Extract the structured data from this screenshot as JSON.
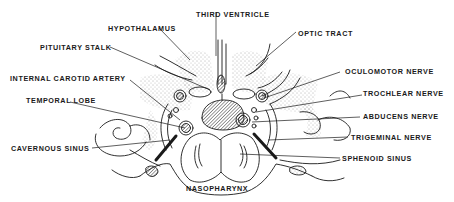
{
  "diagram": {
    "type": "anatomical line drawing (coronal section through sella turcica / cavernous sinus)",
    "colors": {
      "ink": "#1a1a1a",
      "background": "#ffffff",
      "stipple": "#555555"
    },
    "labels": {
      "third_ventricle": "THIRD VENTRICLE",
      "hypothalamus": "HYPOTHALAMUS",
      "optic_tract": "OPTIC TRACT",
      "pituitary_stalk": "PITUITARY STALK",
      "oculomotor_nerve": "OCULOMOTOR NERVE",
      "internal_carotid_artery": "INTERNAL CAROTID ARTERY",
      "trochlear_nerve": "TROCHLEAR NERVE",
      "temporal_lobe": "TEMPORAL LOBE",
      "abducens_nerve": "ABDUCENS NERVE",
      "trigeminal_nerve": "TRIGEMINAL NERVE",
      "cavernous_sinus": "CAVERNOUS SINUS",
      "sphenoid_sinus": "SPHENOID SINUS",
      "nasopharynx": "NASOPHARYNX"
    }
  }
}
